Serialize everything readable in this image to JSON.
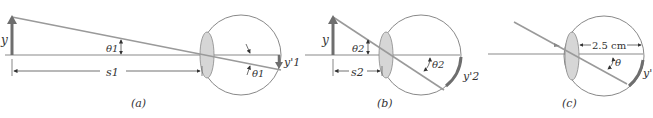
{
  "figure": {
    "panels": [
      {
        "id": "a",
        "caption": "(a)",
        "object_label": "y",
        "angle_label": "θ1",
        "angle_label_eye": "θ1",
        "distance_label": "s1",
        "image_label": "y'1"
      },
      {
        "id": "b",
        "caption": "(b)",
        "object_label": "y",
        "angle_label": "θ2",
        "angle_label_eye": "θ2",
        "distance_label": "s2",
        "image_label": "y'2"
      },
      {
        "id": "c",
        "caption": "(c)",
        "angle_label_eye": "θ",
        "eye_length_label": "2.5 cm",
        "image_label": "y'"
      }
    ],
    "colors": {
      "line": "#8a8a8a",
      "ray": "#9a9a9a",
      "arrow": "#6e6e6e",
      "lens_fill": "#d6d6d6",
      "eye_outline": "#7a7a7a"
    }
  }
}
